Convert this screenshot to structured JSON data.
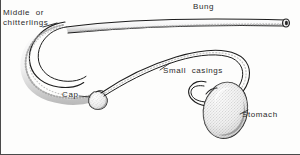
{
  "figure": {
    "kind": "anatomical-line-drawing",
    "background_color": "#fdfdfc",
    "ink_color": "#1d1d1d",
    "label_color": "#2b2b2b",
    "shade_color": "#8c8c8c",
    "width": 300,
    "height": 155
  },
  "labels": {
    "middle_line1": "Middle  or",
    "middle_line2": "chitterlings",
    "bung": "Bung",
    "small_casings": "Small  casings",
    "cap": "Cap",
    "stomach": "Stomach"
  },
  "parts": [
    {
      "name": "bung",
      "label": "Bung",
      "shape": "straight-tapered-tube-with-open-rounded-end"
    },
    {
      "name": "middle",
      "label": "Middle or chitterlings",
      "shape": "thick-lumpy-scalloped-curved-tube"
    },
    {
      "name": "cap",
      "label": "Cap",
      "shape": "small-rounded-stippled-pouch"
    },
    {
      "name": "small-casings",
      "label": "Small casings",
      "shape": "thin-double-line-sweeping-loop"
    },
    {
      "name": "stomach",
      "label": "Stomach",
      "shape": "large-stippled-kidney-bean-organ"
    }
  ]
}
